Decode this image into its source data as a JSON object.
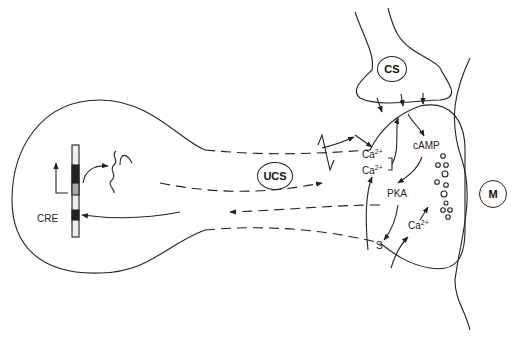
{
  "diagram": {
    "type": "cellular signaling pathway (sensory neuron terminal, conditioning)",
    "nodes": {
      "cs": "CS",
      "ucs": "UCS",
      "m": "M",
      "camp": "cAMP",
      "pka": "PKA",
      "s": "S",
      "cre": "CRE",
      "ca1": "Ca",
      "ca2": "Ca",
      "ca3": "Ca",
      "ca_charge": "2+"
    },
    "edges": [
      {
        "from": "UCS",
        "to": "terminal",
        "style": "solid arrow"
      },
      {
        "from": "CS",
        "to": "terminal",
        "style": "arrows (3)"
      },
      {
        "from": "terminal",
        "to": "cAMP",
        "style": "arrow"
      },
      {
        "from": "cAMP",
        "to": "PKA",
        "style": "arrow"
      },
      {
        "from": "PKA",
        "to": "S",
        "style": "arrow"
      },
      {
        "from": "PKA",
        "to": "nucleus",
        "style": "dashed arrow"
      },
      {
        "from": "nucleus",
        "to": "CRE",
        "style": "arrow"
      },
      {
        "from": "Ca2+ (bracket)",
        "to": "terminal",
        "style": "arrow"
      },
      {
        "from": "S",
        "to": "Ca2+",
        "style": "arrow"
      },
      {
        "from": "Ca2+",
        "to": "vesicles",
        "style": "arrow"
      },
      {
        "from": "gene",
        "to": "mRNA",
        "style": "arrow"
      },
      {
        "from": "mRNA",
        "to": "terminal",
        "style": "dashed arrow"
      }
    ]
  }
}
